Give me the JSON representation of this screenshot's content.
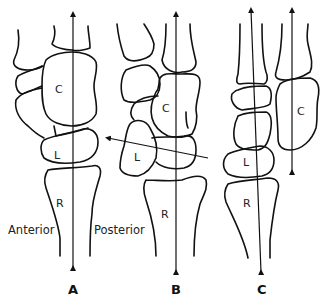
{
  "figure": {
    "colors": {
      "stroke": "#111111",
      "background": "#ffffff"
    },
    "panels": [
      {
        "id": "A",
        "label": "A",
        "bones": {
          "capitate": "C",
          "lunate": "L",
          "radius": "R"
        },
        "orientation_labels": {
          "anterior": "Anterior",
          "posterior": "Posterior"
        },
        "axes": [
          "single vertical axis through radius, lunate and capitate"
        ]
      },
      {
        "id": "B",
        "label": "B",
        "bones": {
          "capitate": "C",
          "lunate": "L",
          "radius": "R"
        },
        "axes": [
          "vertical axis through radius and capitate",
          "oblique lunate axis tilted toward anterior"
        ]
      },
      {
        "id": "C",
        "label": "C",
        "bones": {
          "capitate": "C",
          "lunate": "L",
          "radius": "R"
        },
        "axes": [
          "axis through radius and lunate",
          "separate axis through capitate, displaced posteriorly"
        ]
      }
    ]
  }
}
